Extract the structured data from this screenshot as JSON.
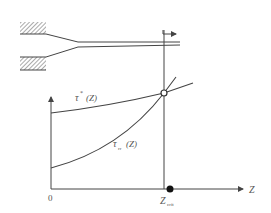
{
  "diagram": {
    "type": "fiber spinning schematic with stress curves",
    "colors": {
      "line": "#444444",
      "hatch": "#555555",
      "text": "#555555",
      "background": "#ffffff"
    },
    "spinneret": {
      "description": "hatched die blocks with converging filament exiting to the right",
      "arrow_direction": "right"
    },
    "axes": {
      "origin_label": "0",
      "x_label": "Z",
      "x_marker_label_main": "Z",
      "x_marker_label_sub": "crit"
    },
    "curves": [
      {
        "name": "tau-star",
        "label_main": "τ",
        "label_sup": "*",
        "label_arg": "(Z)",
        "shape": "slowly increasing"
      },
      {
        "name": "tau-rr",
        "label_main": "τ",
        "label_sub": "rr",
        "label_arg": "(Z)",
        "shape": "rapidly increasing, convex"
      }
    ],
    "intersection": {
      "marker": "open circle",
      "at": "Z_crit"
    },
    "critical_point_marker": {
      "marker": "filled dot",
      "on": "Z axis"
    }
  }
}
